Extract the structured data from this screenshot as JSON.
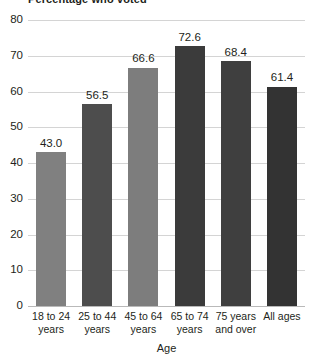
{
  "chart_data": {
    "type": "bar",
    "title": "Percentage who voted",
    "xlabel": "Age",
    "ylabel": "",
    "ylim": [
      0,
      80
    ],
    "yticks": [
      0,
      10,
      20,
      30,
      40,
      50,
      60,
      70,
      80
    ],
    "grid": "horizontal",
    "legend": "none",
    "categories": [
      "18 to 24 years",
      "25 to 44 years",
      "45 to 64 years",
      "65 to 74 years",
      "75 years and over",
      "All ages"
    ],
    "values": [
      43.0,
      56.5,
      66.6,
      72.6,
      68.4,
      61.4
    ],
    "value_labels": [
      "43.0",
      "56.5",
      "66.6",
      "72.6",
      "68.4",
      "61.4"
    ],
    "bar_colors": [
      "#808080",
      "#4d4d4d",
      "#7d7d7d",
      "#3b3b3b",
      "#3f3f3f",
      "#333333"
    ],
    "gridline_color": "#d4d4d4",
    "baseline_color": "#b9b9b9",
    "text_color": "#231f20"
  }
}
